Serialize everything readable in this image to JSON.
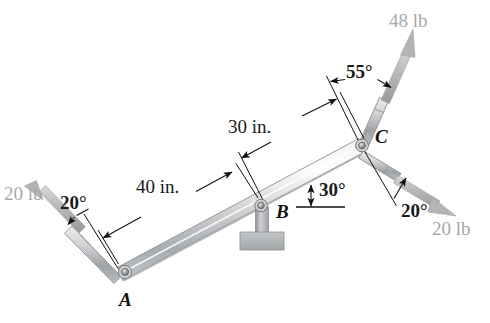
{
  "figure": {
    "background_color": "#ffffff",
    "bar_color": "#c9cbcd",
    "force_label_color": "#a8a8a8",
    "annotation_color": "#1a1a1a",
    "support_color": "#b5b7b9"
  },
  "points": {
    "a": {
      "label": "A",
      "x": 125,
      "y": 272
    },
    "b": {
      "label": "B",
      "x": 261,
      "y": 206
    },
    "c": {
      "label": "C",
      "x": 362,
      "y": 145
    }
  },
  "forces": [
    {
      "name": "force-at-a",
      "label": "20 lb",
      "magnitude": 20,
      "unit": "lb",
      "angle_label": "20°",
      "angle_deg": 20,
      "direction": "up-left"
    },
    {
      "name": "force-at-c-upper",
      "label": "48 lb",
      "magnitude": 48,
      "unit": "lb",
      "angle_label": "55°",
      "angle_deg": 55,
      "direction": "up-right"
    },
    {
      "name": "force-at-c-lower",
      "label": "20 lb",
      "magnitude": 20,
      "unit": "lb",
      "angle_label": "20°",
      "angle_deg": 20,
      "direction": "down-right"
    }
  ],
  "dimensions": [
    {
      "name": "dimension-a-to-b",
      "label": "40 in.",
      "value": 40,
      "unit": "in."
    },
    {
      "name": "dimension-b-to-c",
      "label": "30 in.",
      "value": 30,
      "unit": "in."
    }
  ],
  "angles": [
    {
      "name": "bar-inclination",
      "label": "30°",
      "value": 30,
      "unit": "°",
      "reference": "horizontal"
    }
  ],
  "labels": {
    "force_a": "20 lb",
    "angle_a": "20°",
    "dim_ab": "40 in.",
    "dim_bc": "30 in.",
    "angle_bar": "30°",
    "angle_c_upper": "55°",
    "force_c_upper": "48 lb",
    "angle_c_lower": "20°",
    "force_c_lower": "20 lb",
    "point_a": "A",
    "point_b": "B",
    "point_c": "C"
  }
}
